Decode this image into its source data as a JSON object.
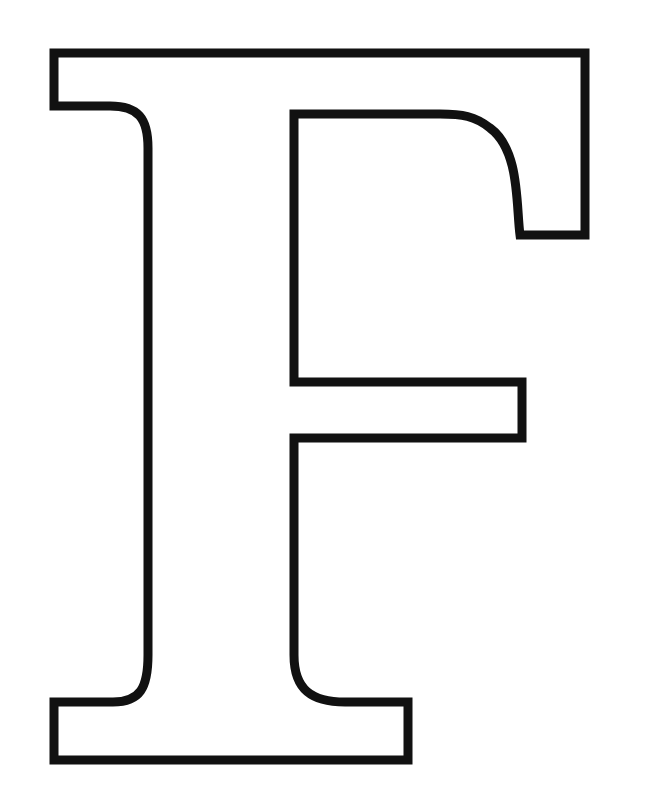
{
  "image": {
    "subject": "Outlined serif capital letter",
    "letter": "F",
    "style": "outline",
    "stroke_color": "#111111",
    "fill_color": "#ffffff",
    "background_color": "#ffffff",
    "stroke_width": 9
  }
}
